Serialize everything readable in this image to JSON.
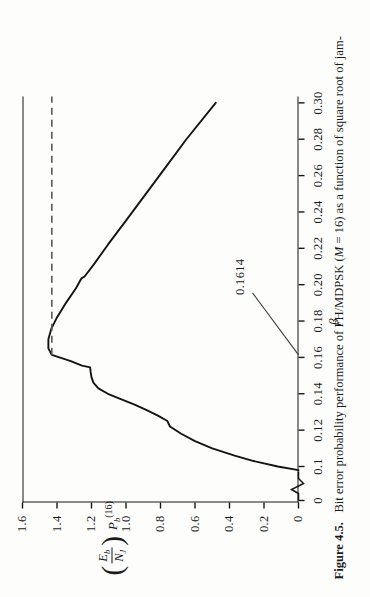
{
  "figure": {
    "number": "Figure 4.5.",
    "caption": "Bit error probability performance of FH/MDPSK (M = 16) as a function of square root of jam-",
    "caption_italic_token": "M",
    "caption_plain": "Bit error probability performance of FH/MDPSK (",
    "caption_rest": " = 16) as a function of square root of jam-"
  },
  "annotation": {
    "value_label": "0.1614",
    "leader": "line from label to x-axis at beta = 0.1614",
    "dashed_line": "horizontal dashed line at peak level"
  },
  "axis_titles": {
    "x": "β",
    "y_paren_open": "(",
    "y_paren_close": ")",
    "y_num": "E",
    "y_num_sub": "b",
    "y_den": "N",
    "y_den_sub": "J",
    "y_pb": "P",
    "y_pb_sub": "b",
    "y_pb_sup": "(16)"
  },
  "chart_data": {
    "type": "line",
    "title": "Bit error probability performance of FH/MDPSK (M = 16)",
    "xlabel": "β",
    "ylabel": "(Eb/NJ) Pb(16)",
    "xlim": [
      0.09,
      0.3
    ],
    "ylim": [
      0,
      1.6
    ],
    "grid": false,
    "legend": "none",
    "axis_break_x": true,
    "xticks": [
      "0",
      "0.1",
      "0.12",
      "0.14",
      "0.16",
      "0.18",
      "0.20",
      "0.22",
      "0.24",
      "0.26",
      "0.28",
      "0.30"
    ],
    "xtick_values": [
      0,
      0.1,
      0.12,
      0.14,
      0.16,
      0.18,
      0.2,
      0.22,
      0.24,
      0.26,
      0.28,
      0.3
    ],
    "yticks": [
      "0",
      "0.2",
      "0.4",
      "0.6",
      "0.8",
      "1.0",
      "1.2",
      "1.4",
      "1.6"
    ],
    "ytick_values": [
      0,
      0.2,
      0.4,
      0.6,
      0.8,
      1.0,
      1.2,
      1.4,
      1.6
    ],
    "annotations": [
      {
        "text": "0.1614",
        "x": 0.1614,
        "y": 0,
        "note": "peak location marked with dashed horizontal line"
      }
    ],
    "series": [
      {
        "name": "FH/MDPSK M=16",
        "x": [
          0.098,
          0.1,
          0.103,
          0.106,
          0.11,
          0.114,
          0.118,
          0.122,
          0.125,
          0.128,
          0.131,
          0.134,
          0.137,
          0.14,
          0.143,
          0.146,
          0.149,
          0.152,
          0.1545,
          0.1555,
          0.158,
          0.1614,
          0.165,
          0.17,
          0.176,
          0.182,
          0.19,
          0.198,
          0.2035,
          0.2045,
          0.212,
          0.222,
          0.234,
          0.248,
          0.264,
          0.28,
          0.3
        ],
        "values": [
          0.0,
          0.12,
          0.26,
          0.37,
          0.5,
          0.6,
          0.68,
          0.745,
          0.76,
          0.815,
          0.88,
          0.95,
          1.03,
          1.105,
          1.16,
          1.188,
          1.2,
          1.205,
          1.208,
          1.255,
          1.32,
          1.43,
          1.45,
          1.45,
          1.432,
          1.4,
          1.348,
          1.29,
          1.258,
          1.24,
          1.18,
          1.105,
          1.01,
          0.9,
          0.775,
          0.65,
          0.48
        ]
      }
    ]
  }
}
